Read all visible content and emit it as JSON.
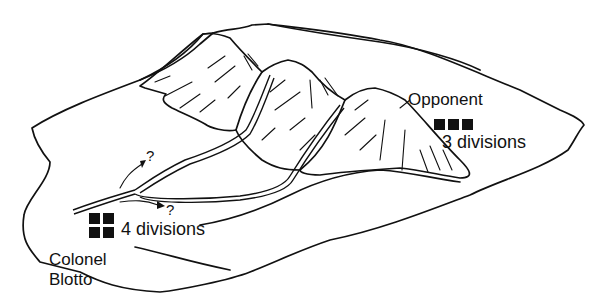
{
  "diagram": {
    "type": "illustration",
    "colors": {
      "ink": "#111111",
      "background": "#ffffff"
    }
  },
  "player": {
    "name_line1": "Colonel",
    "name_line2": "Blotto",
    "divisions_label": "4 divisions",
    "divisions_count": 4
  },
  "opponent": {
    "name": "Opponent",
    "divisions_label": "3 divisions",
    "divisions_count": 3
  },
  "routes": {
    "upper_question": "?",
    "lower_question": "?"
  }
}
